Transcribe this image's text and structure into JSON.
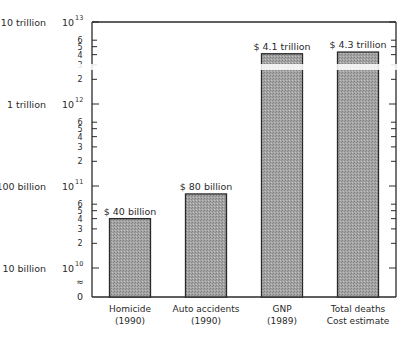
{
  "chart_data": {
    "type": "bar",
    "title": "",
    "xlabel": "",
    "ylabel": "",
    "yscale": "log",
    "ylim": [
      10000000000.0,
      10000000000000.0
    ],
    "axis_break": true,
    "grid": false,
    "legend": "none",
    "categories": [
      {
        "line1": "Homicide",
        "line2": "(1990)"
      },
      {
        "line1": "Auto accidents",
        "line2": "(1990)"
      },
      {
        "line1": "GNP",
        "line2": "(1989)"
      },
      {
        "line1": "Total deaths",
        "line2": "Cost estimate"
      }
    ],
    "values": [
      40000000000.0,
      80000000000.0,
      4100000000000.0,
      4300000000000.0
    ],
    "data_labels": [
      "$ 40 billion",
      "$ 80 billion",
      "$ 4.1 trillion",
      "$ 4.3 trillion"
    ],
    "major_ticks": [
      {
        "value": 10000000000000.0,
        "name_label": "10 trillion",
        "base": "10",
        "exp": "13"
      },
      {
        "value": 1000000000000.0,
        "name_label": "1 trillion",
        "base": "10",
        "exp": "12"
      },
      {
        "value": 100000000000.0,
        "name_label": "100 billion",
        "base": "10",
        "exp": "11"
      },
      {
        "value": 10000000000.0,
        "name_label": "10 billion",
        "base": "10",
        "exp": "10"
      }
    ],
    "minor_ticks": [
      {
        "value": 6000000000000.0,
        "label": "6"
      },
      {
        "value": 5000000000000.0,
        "label": "5"
      },
      {
        "value": 4000000000000.0,
        "label": "4"
      },
      {
        "value": 3000000000000.0,
        "label": "3"
      },
      {
        "value": 2000000000000.0,
        "label": "2"
      },
      {
        "value": 600000000000.0,
        "label": "6"
      },
      {
        "value": 500000000000.0,
        "label": "5"
      },
      {
        "value": 400000000000.0,
        "label": "4"
      },
      {
        "value": 300000000000.0,
        "label": "3"
      },
      {
        "value": 200000000000.0,
        "label": "2"
      },
      {
        "value": 60000000000.0,
        "label": "6"
      },
      {
        "value": 50000000000.0,
        "label": "5"
      },
      {
        "value": 40000000000.0,
        "label": "4"
      },
      {
        "value": 30000000000.0,
        "label": "3"
      },
      {
        "value": 20000000000.0,
        "label": "2"
      }
    ],
    "zero_label": "0",
    "break_symbol": "≈",
    "bar_fill": "#9a9a9a",
    "bar_stroke": "#2a2a2a"
  }
}
